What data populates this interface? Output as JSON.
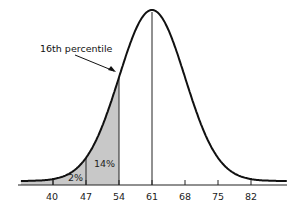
{
  "chart_data": {
    "type": "area",
    "title": "",
    "subtitle": "",
    "xlabel": "",
    "ylabel": "",
    "distribution": "normal",
    "mean": 61,
    "sd": 7,
    "x_ticks": [
      40,
      47,
      54,
      61,
      68,
      75,
      82
    ],
    "x_tick_labels": [
      "40",
      "47",
      "54",
      "61",
      "68",
      "75",
      "82"
    ],
    "xlim": [
      33,
      89
    ],
    "grid": false,
    "legend": null,
    "shaded_regions": [
      {
        "from": 33,
        "to": 47,
        "label": "",
        "color": "#c8c8c8"
      },
      {
        "from": 47,
        "to": 54,
        "label": "",
        "color": "#c8c8c8"
      }
    ],
    "region_labels": [
      {
        "text": "2%",
        "between": [
          40,
          47
        ]
      },
      {
        "text": "14%",
        "between": [
          47,
          54
        ]
      }
    ],
    "vertical_lines": [
      40,
      47,
      54,
      61
    ],
    "annotations": [
      {
        "text": "16th percentile",
        "points_to": 54
      }
    ]
  },
  "labels": {
    "annotation": "16th percentile",
    "pct_2": "2%",
    "pct_14": "14%",
    "ticks": [
      "40",
      "47",
      "54",
      "61",
      "68",
      "75",
      "82"
    ]
  },
  "colors": {
    "curve": "#111111",
    "shade": "#c8c8c8",
    "axis": "#222222"
  }
}
